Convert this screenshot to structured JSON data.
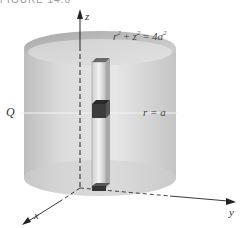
{
  "figure": {
    "caption": "FIGURE 14.6",
    "labels": {
      "z_axis": "z",
      "x_axis": "x",
      "y_axis": "y",
      "point_q": "Q",
      "sphere_eq": {
        "r": "r",
        "r_exp": "2",
        "plus": " + ",
        "z": "z",
        "z_exp": "2",
        "equals": " = ",
        "rhs": "4a",
        "rhs_exp": "2"
      },
      "cylinder_eq": "r = a"
    },
    "colors": {
      "cylinder_fill": "#d4d4d4",
      "cylinder_top": "#c2c2c2",
      "prism_dark": "#3a3a3a",
      "axis": "#222222"
    }
  }
}
